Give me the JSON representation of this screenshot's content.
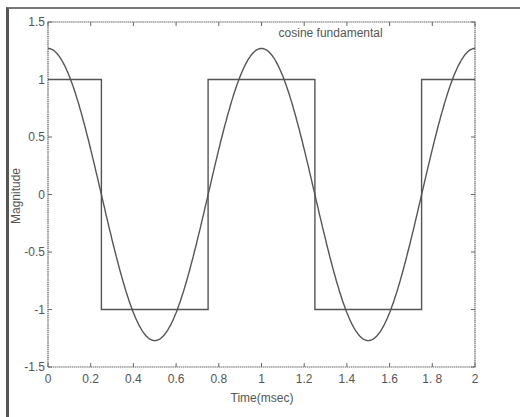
{
  "chart_data": {
    "type": "line",
    "title": "",
    "xlabel": "Time(msec)",
    "ylabel": "Magnitude",
    "xlim": [
      0,
      2
    ],
    "ylim": [
      -1.5,
      1.5
    ],
    "grid": false,
    "x_ticks": [
      0,
      0.2,
      0.4,
      0.6,
      0.8,
      1,
      1.2,
      1.4,
      1.6,
      1.8,
      2
    ],
    "x_tick_labels": [
      "0",
      "0.2",
      "0.4",
      "0.6",
      "0.8",
      "1",
      "1.2",
      "1.4",
      "1.6",
      "1. 8",
      "2"
    ],
    "y_ticks": [
      1.5,
      1,
      0.5,
      0,
      -0.5,
      -1,
      -1.5
    ],
    "y_tick_labels": [
      "1.5",
      "1",
      "0.5",
      "0",
      "-0.5",
      "-1",
      "-1.5"
    ],
    "annotations": [
      {
        "text": "cosine fundamental",
        "x": 1.08,
        "y": 1.37
      }
    ],
    "series": [
      {
        "name": "square wave",
        "style": "step",
        "x": [
          0,
          0.25,
          0.25,
          0.75,
          0.75,
          1.25,
          1.25,
          1.75,
          1.75,
          2
        ],
        "values": [
          1,
          1,
          -1,
          -1,
          1,
          1,
          -1,
          -1,
          1,
          1
        ]
      },
      {
        "name": "cosine fundamental",
        "style": "smooth",
        "function": "1.27*cos(2*pi*t)",
        "amplitude": 1.27,
        "period_msec": 1,
        "x": [
          0,
          0.25,
          0.5,
          0.75,
          1,
          1.25,
          1.5,
          1.75,
          2
        ],
        "values": [
          1.27,
          0,
          -1.27,
          0,
          1.27,
          0,
          -1.27,
          0,
          1.27
        ]
      }
    ]
  },
  "colors": {
    "line": "#555555",
    "axis": "#666666",
    "text": "#555555"
  }
}
